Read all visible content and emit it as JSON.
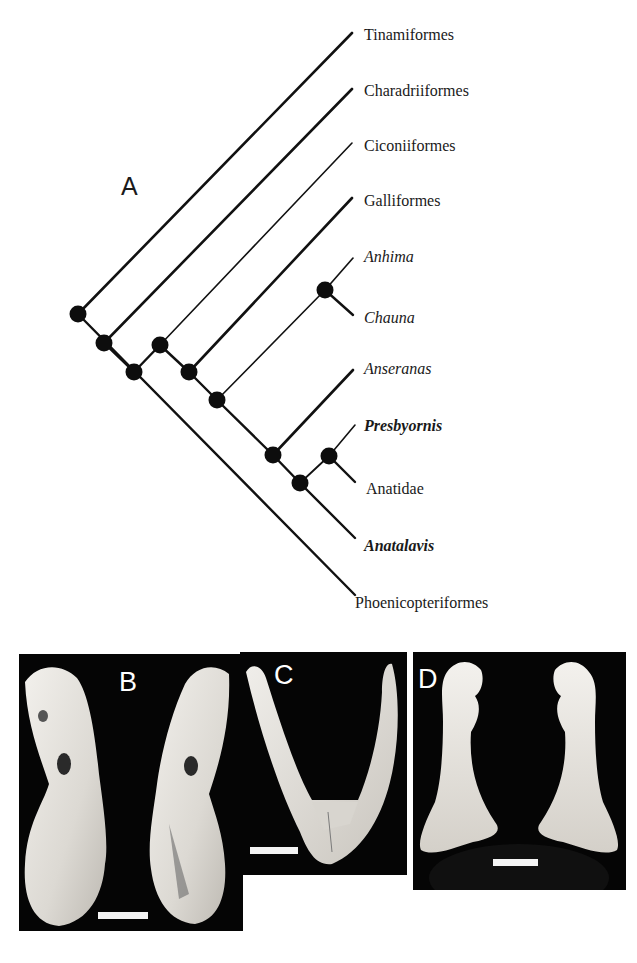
{
  "figure": {
    "panel_a_label": "A",
    "taxa": [
      {
        "name": "Tinamiformes",
        "style": "roman"
      },
      {
        "name": "Charadriiformes",
        "style": "roman"
      },
      {
        "name": "Ciconiiformes",
        "style": "roman"
      },
      {
        "name": "Galliformes",
        "style": "roman"
      },
      {
        "name": "Anhima",
        "style": "italic"
      },
      {
        "name": "Chauna",
        "style": "italic"
      },
      {
        "name": "Anseranas",
        "style": "italic"
      },
      {
        "name": "Presbyornis",
        "style": "bold-italic"
      },
      {
        "name": "Anatidae",
        "style": "roman"
      },
      {
        "name": "Anatalavis",
        "style": "bold-italic"
      },
      {
        "name": "Phoenicopteriformes",
        "style": "roman"
      }
    ],
    "photo_panels": [
      {
        "label": "B",
        "content": "Fossil bone specimen, two views, with scale bar"
      },
      {
        "label": "C",
        "content": "V-shaped fossil bone (furcula), with scale bar"
      },
      {
        "label": "D",
        "content": "Fossil bone specimen, two views, with scale bar"
      }
    ],
    "colors": {
      "line": "#111111",
      "node": "#0d0d0d",
      "photo_background": "#050505",
      "bone": "#e8e6e2",
      "label_on_photo": "#ffffff"
    }
  }
}
